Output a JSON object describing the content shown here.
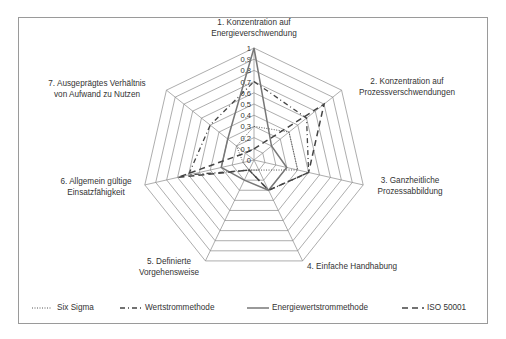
{
  "chart_data": {
    "type": "radar",
    "title": "",
    "axes": [
      "1. Konzentration auf Energieverschwendung",
      "2. Konzentration auf Prozessverschwendungen",
      "3. Ganzheitliche Prozessabbildung",
      "4. Einfache Handhabung",
      "5. Definierte Vorgehensweise",
      "6. Allgemein gültige Einsatzfähigkeit",
      "7. Ausgeprägtes Verhältnis von Aufwand zu Nutzen"
    ],
    "axis_label_lines": [
      [
        "1. Konzentration auf",
        "Energieverschwendung"
      ],
      [
        "2. Konzentration auf",
        "Prozessverschwendungen"
      ],
      [
        "3. Ganzheitliche",
        "Prozessabbildung"
      ],
      [
        "4. Einfache Handhabung"
      ],
      [
        "5. Definierte",
        "Vorgehensweise"
      ],
      [
        "6. Allgemein gültige",
        "Einsatzfähigkeit"
      ],
      [
        "7. Ausgeprägtes Verhältnis",
        "von Aufwand zu Nutzen"
      ]
    ],
    "ticks": [
      "0",
      "0,1",
      "0,2",
      "0,3",
      "0,4",
      "0,5",
      "0,6",
      "0,7",
      "0,8",
      "0,9",
      "1"
    ],
    "range": [
      0,
      1
    ],
    "grid": true,
    "legend_position": "bottom",
    "series": [
      {
        "name": "Six Sigma",
        "style": "dotted",
        "values": [
          0.3,
          0.4,
          0.4,
          0.1,
          0.1,
          0.1,
          0.2
        ]
      },
      {
        "name": "Wertstrommethode",
        "style": "dash-dot",
        "values": [
          0.7,
          0.6,
          0.5,
          0.3,
          0.1,
          0.6,
          0.5
        ]
      },
      {
        "name": "Energiewertstrommethode",
        "style": "solid",
        "values": [
          1.0,
          0.2,
          0.3,
          0.3,
          0.2,
          0.3,
          0.3
        ]
      },
      {
        "name": "ISO 50001",
        "style": "dashed",
        "values": [
          0.1,
          0.8,
          0.5,
          0.3,
          0.1,
          0.7,
          0.1
        ]
      }
    ]
  },
  "legend": {
    "items": [
      {
        "label": "Six Sigma"
      },
      {
        "label": "Wertstrommethode"
      },
      {
        "label": "Energiewertstrommethode"
      },
      {
        "label": "ISO 50001"
      }
    ]
  }
}
